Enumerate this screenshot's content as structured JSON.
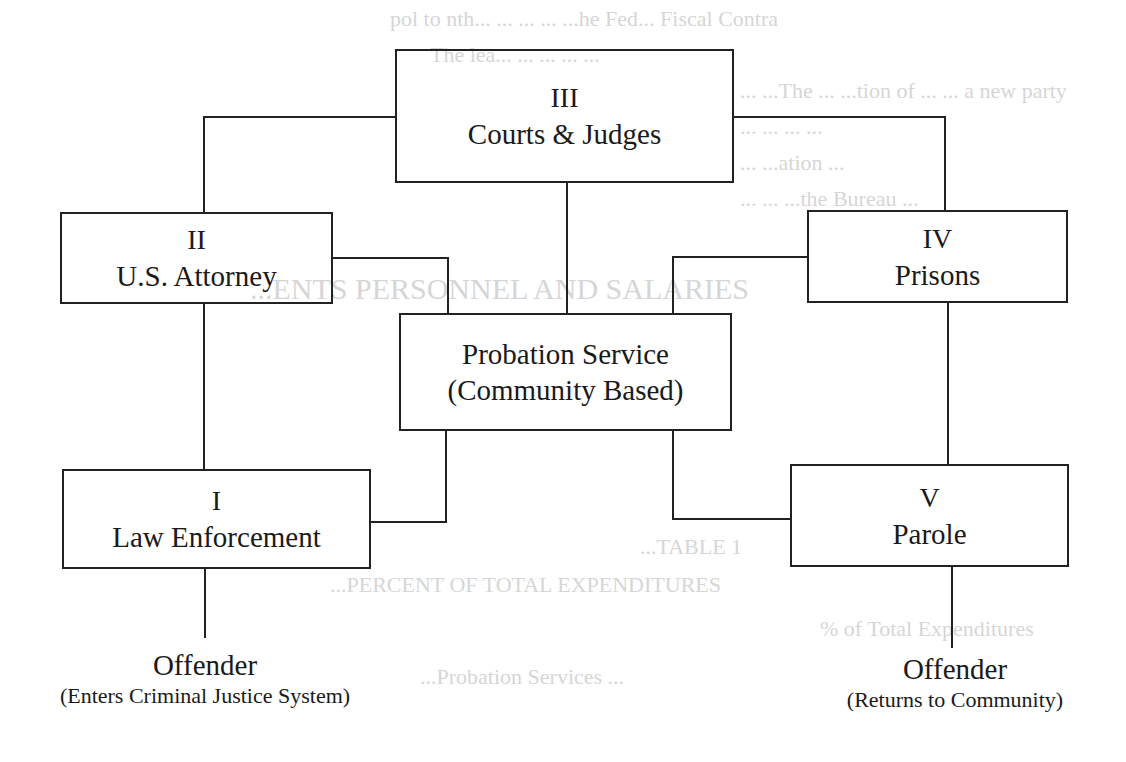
{
  "diagram": {
    "nodes": {
      "courts": {
        "number": "III",
        "label": "Courts & Judges"
      },
      "attorney": {
        "number": "II",
        "label": "U.S. Attorney"
      },
      "prisons": {
        "number": "IV",
        "label": "Prisons"
      },
      "probation": {
        "line1": "Probation Service",
        "line2": "(Community Based)"
      },
      "law_enforcement": {
        "number": "I",
        "label": "Law Enforcement"
      },
      "parole": {
        "number": "V",
        "label": "Parole"
      }
    },
    "offender_in": {
      "title": "Offender",
      "subtitle": "(Enters Criminal Justice System)"
    },
    "offender_out": {
      "title": "Offender",
      "subtitle": "(Returns to Community)"
    }
  },
  "background_bleed": {
    "lines": [
      "pol to nth... ... ... ... ...he Fed... Fiscal Contra",
      "The lea... ... ... ... ...",
      "... ...The ... ...tion of ...  ... a new party",
      "...  ...  ... ...",
      "... ...ation ...",
      "... ... ...the Bureau ...",
      "...ENTS PERSONNEL AND SALARIES",
      "...TABLE 1",
      "...PERCENT OF TOTAL EXPENDITURES",
      "% of Total Expenditures",
      "...Probation Services ..."
    ]
  }
}
